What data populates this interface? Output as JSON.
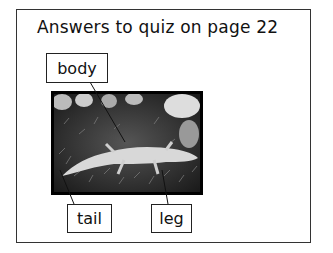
{
  "title": "Answers to quiz on page 22",
  "labels": {
    "body": "body",
    "tail": "tail",
    "leg": "leg"
  },
  "image": {
    "subject": "lizard-on-moss-photo"
  }
}
